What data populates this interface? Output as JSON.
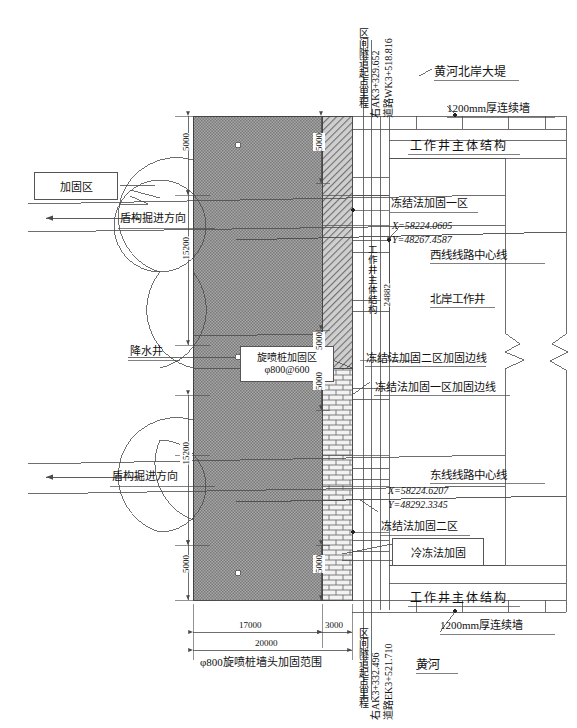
{
  "drawing": {
    "title": "黄河隧道北岸工作井加固平面图",
    "colors": {
      "line": "#4a4a4a",
      "text": "#111111",
      "fill_dot": "#8f8f8f",
      "fill_hatch": "#b9b9b9",
      "fill_brick": "#e8e8e8"
    }
  },
  "callouts": {
    "reinforce_zone": "加固区",
    "freeze_method": "冷冻法加固"
  },
  "left_annotations": {
    "shield_direction_upper": "盾构掘进方向",
    "shield_direction_lower": "盾构掘进方向",
    "dewatering_well": "降水井"
  },
  "center_labels": {
    "jet_grouting_zone_line1": "旋喷桩加固区",
    "jet_grouting_zone_line2": "φ800@600"
  },
  "right_labels": {
    "yellow_river_north_dike": "黄河北岸大堤",
    "diaphragm_wall_top": "1200mm厚连续墙",
    "shaft_main_structure_top": "工作井主体结构",
    "freeze_zone_one": "冻结法加固一区",
    "west_line_center": "西线线路中心线",
    "north_bank_shaft": "北岸工作井",
    "freeze_zone_two_boundary": "冻结法加固二区加固边线",
    "freeze_zone_one_boundary": "冻结法加固一区加固边线",
    "east_line_center": "东线线路中心线",
    "freeze_zone_two": "冻结法加固二区",
    "shaft_main_structure_bottom": "工作井主体结构",
    "diaphragm_wall_bottom": "1200mm厚连续墙",
    "yellow_river": "黄河",
    "shaft_main_structure_vertical": "工作井主体结构"
  },
  "coordinates": {
    "west_line": {
      "x_label": "X=58224.0605",
      "y_label": "Y=48267.4587"
    },
    "east_line": {
      "x_label": "X=58224.6207",
      "y_label": "Y=48292.3345"
    }
  },
  "chainage": {
    "top": {
      "line1": "区间隧道起点里程",
      "line2": "右AK3+329.652",
      "line3": "道路WK3+518.816"
    },
    "bottom": {
      "line1": "区间隧道起点里程",
      "line2": "右AK3+332.496",
      "line3": "道路EK3+521.710"
    }
  },
  "dimensions": {
    "left_top_5000": "5000",
    "left_upper_15200": "15200",
    "left_lower_15200": "15200",
    "left_bottom_5000": "5000",
    "right_d1_5000": "5000",
    "right_d2_5000": "5000",
    "right_d3_5000": "5000",
    "right_d4_5000": "5000",
    "shaft_width_24882": "24882",
    "bottom_17000": "17000",
    "bottom_3000": "3000",
    "bottom_20000": "20000",
    "bottom_note": "φ800旋喷桩墙头加固范围"
  }
}
